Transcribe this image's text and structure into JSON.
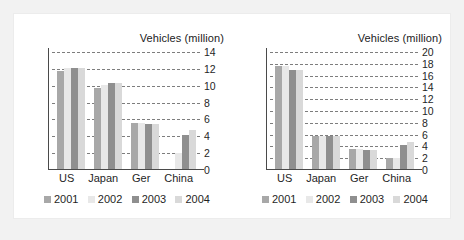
{
  "figure": {
    "background_color": "#f2f2f2",
    "panel_color": "#ffffff"
  },
  "series_colors": {
    "2001": "#a8a8a8",
    "2002": "#e8e8e8",
    "2003": "#8f8f8f",
    "2004": "#d9d9d9"
  },
  "chart_data": [
    {
      "type": "bar",
      "id": "left-chart",
      "title": "Vehicles (million)",
      "xlabel": "",
      "ylabel": "Vehicles (million)",
      "categories": [
        "US",
        "Japan",
        "Ger",
        "China"
      ],
      "series": [
        {
          "name": "2001",
          "values": [
            11.7,
            9.7,
            5.6,
            0.0
          ]
        },
        {
          "name": "2002",
          "values": [
            12.1,
            10.1,
            5.6,
            2.0
          ]
        },
        {
          "name": "2003",
          "values": [
            12.1,
            10.3,
            5.5,
            4.2
          ]
        },
        {
          "name": "2004",
          "values": [
            12.1,
            10.3,
            5.5,
            4.8
          ]
        }
      ],
      "ylim": [
        0,
        14
      ],
      "yticks": [
        0,
        2,
        4,
        6,
        8,
        10,
        12,
        14
      ],
      "ytick_labels": [
        "0",
        "2",
        "4",
        "6",
        "8",
        "10",
        "12",
        "14"
      ],
      "grid": true,
      "grid_style": "dashed",
      "legend_position": "bottom",
      "legend": [
        "2001",
        "2002",
        "2003",
        "2004"
      ]
    },
    {
      "type": "bar",
      "id": "right-chart",
      "title": "Vehicles (million)",
      "xlabel": "",
      "ylabel": "Vehicles (million)",
      "categories": [
        "US",
        "Japan",
        "Ger",
        "China"
      ],
      "series": [
        {
          "name": "2001",
          "values": [
            17.7,
            5.8,
            3.6,
            2.0
          ]
        },
        {
          "name": "2002",
          "values": [
            17.7,
            5.8,
            3.6,
            2.0
          ]
        },
        {
          "name": "2003",
          "values": [
            17.0,
            5.8,
            3.4,
            4.2
          ]
        },
        {
          "name": "2004",
          "values": [
            17.0,
            5.8,
            3.4,
            4.8
          ]
        }
      ],
      "ylim": [
        0,
        20
      ],
      "yticks": [
        0,
        2,
        4,
        6,
        8,
        10,
        12,
        14,
        16,
        18,
        20
      ],
      "ytick_labels": [
        "0",
        "2",
        "4",
        "6",
        "8",
        "10",
        "12",
        "14",
        "16",
        "18",
        "20"
      ],
      "grid": true,
      "grid_style": "dashed",
      "legend_position": "bottom",
      "legend": [
        "2001",
        "2002",
        "2003",
        "2004"
      ]
    }
  ]
}
